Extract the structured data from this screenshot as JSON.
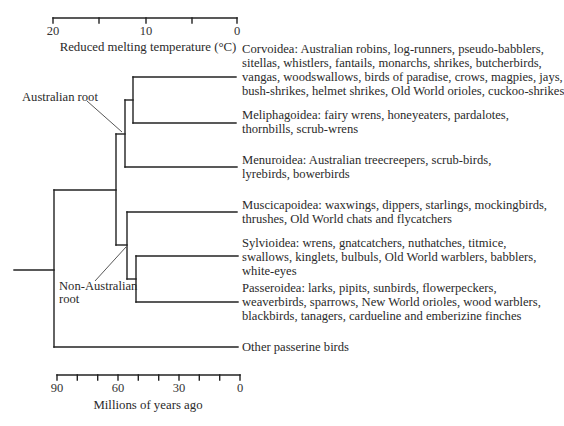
{
  "top_axis": {
    "title": "Reduced melting temperature (°C)",
    "tick_labels": [
      "20",
      "10",
      "0"
    ]
  },
  "bottom_axis": {
    "title": "Millions of years ago",
    "tick_labels": [
      "90",
      "60",
      "30",
      "0"
    ]
  },
  "annotations": {
    "australian_root": "Australian root",
    "non_australian_root_line1": "Non-Australian",
    "non_australian_root_line2": "root"
  },
  "clades": [
    {
      "name": "Corvoidea",
      "lines": [
        "Corvoidea: Australian robins, log-runners, pseudo-babblers,",
        "sitellas, whistlers, fantails, monarchs, shrikes, butcherbirds,",
        "vangas, woodswallows, birds of paradise, crows, magpies, jays,",
        "bush-shrikes, helmet shrikes, Old World orioles, cuckoo-shrikes"
      ]
    },
    {
      "name": "Meliphagoidea",
      "lines": [
        "Meliphagoidea: fairy wrens, honeyeaters, pardalotes,",
        "thornbills, scrub-wrens"
      ]
    },
    {
      "name": "Menuroidea",
      "lines": [
        "Menuroidea: Australian treecreepers, scrub-birds,",
        "lyrebirds, bowerbirds"
      ]
    },
    {
      "name": "Muscicapoidea",
      "lines": [
        "Muscicapoidea: waxwings, dippers, starlings, mockingbirds,",
        "thrushes, Old World chats and flycatchers"
      ]
    },
    {
      "name": "Sylvioidea",
      "lines": [
        "Sylvioidea: wrens, gnatcatchers, nuthatches, titmice,",
        "swallows, kinglets, bulbuls, Old World warblers, babblers,",
        "white-eyes"
      ]
    },
    {
      "name": "Passeroidea",
      "lines": [
        "Passeroidea: larks, pipits, sunbirds, flowerpeckers,",
        "weaverbirds, sparrows, New World orioles, wood warblers,",
        "blackbirds, tanagers, cardueline and emberizine finches"
      ]
    },
    {
      "name": "Other",
      "lines": [
        "Other passerine birds"
      ]
    }
  ]
}
